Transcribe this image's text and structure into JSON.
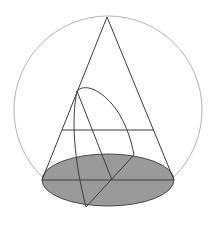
{
  "diagram": {
    "colors": {
      "background": "#ffffff",
      "sphere_stroke": "#b4b4b4",
      "line_stroke": "#3c3c3c",
      "base_fill": "#9a9a9a",
      "base_stroke": "#4a4a4a"
    },
    "sphere": {
      "cx": 108,
      "cy": 110,
      "r": 94
    },
    "apex": {
      "x": 107,
      "y": 17
    },
    "base_ellipse": {
      "cx": 108,
      "cy": 180,
      "rx": 66,
      "ry": 26
    },
    "section_chord": {
      "y": 130,
      "x1": 62,
      "x2": 154
    },
    "base_diameter": {
      "y": 180,
      "x1": 42,
      "x2": 174
    },
    "points": {
      "curve_start": {
        "x": 77,
        "y": 91
      },
      "base_top_right": {
        "x": 134,
        "y": 155
      },
      "base_center": {
        "x": 112,
        "y": 180
      },
      "base_bottom": {
        "x": 86,
        "y": 207
      }
    }
  }
}
